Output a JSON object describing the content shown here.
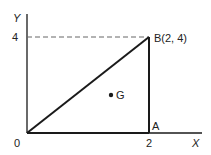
{
  "diagram": {
    "axes": {
      "y_label": "Y",
      "x_label": "X",
      "y_tick": "4",
      "x_tick": "2",
      "origin_label": "0"
    },
    "points": {
      "B": "B(2, 4)",
      "A": "A",
      "G": "G"
    },
    "colors": {
      "line": "#1a1a1a",
      "dashed": "#666666"
    }
  }
}
